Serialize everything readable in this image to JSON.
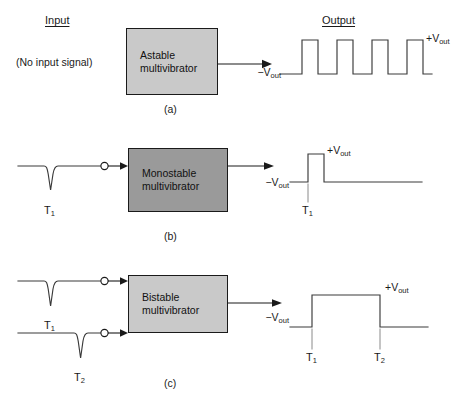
{
  "figure": {
    "headers": {
      "input": "Input",
      "output": "Output"
    },
    "sections": [
      {
        "caption": "(a)",
        "block_label": "Astable\nmultivibrator",
        "block_shade": "#c9c9c9",
        "input_text": "(No input signal)",
        "input_pulses": [],
        "output": {
          "low_label": "−Vout",
          "low_label_text": "−V",
          "low_label_sub": "out",
          "high_label_text": "+V",
          "high_label_sub": "out",
          "waveform": "square-wave-4-pulses",
          "pulse_count": 4,
          "time_markers": []
        }
      },
      {
        "caption": "(b)",
        "block_label": "Monostable\nmultivibrator",
        "block_shade": "#9a9a9a",
        "input_text": "",
        "input_pulses": [
          {
            "label_text": "T",
            "label_sub": "1",
            "direction": "negative"
          }
        ],
        "output": {
          "low_label_text": "−V",
          "low_label_sub": "out",
          "high_label_text": "+V",
          "high_label_sub": "out",
          "waveform": "single-narrow-pulse",
          "pulse_count": 1,
          "time_markers": [
            {
              "label_text": "T",
              "label_sub": "1"
            }
          ]
        }
      },
      {
        "caption": "(c)",
        "block_label": "Bistable\nmultivibrator",
        "block_shade": "#c9c9c9",
        "input_text": "",
        "input_pulses": [
          {
            "label_text": "T",
            "label_sub": "1",
            "direction": "negative"
          },
          {
            "label_text": "T",
            "label_sub": "2",
            "direction": "negative"
          }
        ],
        "output": {
          "low_label_text": "−V",
          "low_label_sub": "out",
          "high_label_text": "+V",
          "high_label_sub": "out",
          "waveform": "single-wide-pulse",
          "pulse_count": 1,
          "time_markers": [
            {
              "label_text": "T",
              "label_sub": "1"
            },
            {
              "label_text": "T",
              "label_sub": "2"
            }
          ]
        }
      }
    ],
    "colors": {
      "stroke": "#3a3a3a",
      "connector": "#1a1a1a",
      "block_border": "#1a1a1a",
      "background": "#ffffff"
    }
  }
}
